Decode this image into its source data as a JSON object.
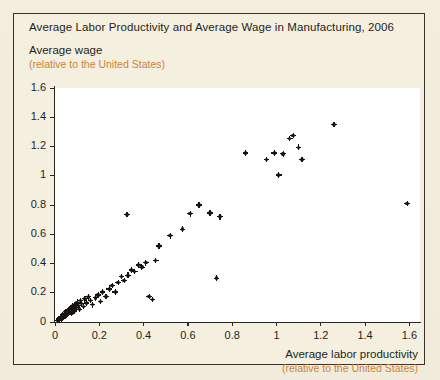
{
  "figure": {
    "title": "Average Labor Productivity and Average Wage in Manufacturing, 2006"
  },
  "axes": {
    "y_label_main": "Average wage",
    "y_label_sub": "(relative to the United States)",
    "x_label_main": "Average labor productivity",
    "x_label_sub": "(relative to the United States)"
  },
  "colors": {
    "page_background": "#f3eddd",
    "plot_background": "#ffffff",
    "frame_border": "#3a3228",
    "axis": "#2b2620",
    "text": "#241f1a",
    "accent_sub_label": "#c8853c",
    "marker": "#17140f"
  },
  "chart_data": {
    "type": "scatter",
    "title": "Average Labor Productivity and Average Wage in Manufacturing, 2006",
    "xlabel": "Average labor productivity (relative to the United States)",
    "ylabel": "Average wage (relative to the United States)",
    "xlim": [
      0,
      1.65
    ],
    "ylim": [
      0,
      1.6
    ],
    "xticks": [
      0,
      0.2,
      0.4,
      0.6,
      0.8,
      1,
      1.2,
      1.4,
      1.6
    ],
    "xtick_labels": [
      "0",
      "0.2",
      "0.4",
      "0.6",
      "0.8",
      "1",
      "1.2",
      "1.4",
      "1.6"
    ],
    "yticks": [
      0,
      0.2,
      0.4,
      0.6,
      0.8,
      1,
      1.2,
      1.4,
      1.6
    ],
    "ytick_labels": [
      "0",
      "0.2",
      "0.4",
      "0.6",
      "0.8",
      "1",
      "1.2",
      "1.4",
      "1.6"
    ],
    "grid": false,
    "legend": null,
    "marker_style": "plus-dot",
    "series": [
      {
        "name": "Countries",
        "points": [
          [
            0.01,
            0.012
          ],
          [
            0.015,
            0.018
          ],
          [
            0.018,
            0.022
          ],
          [
            0.022,
            0.015
          ],
          [
            0.025,
            0.03
          ],
          [
            0.028,
            0.022
          ],
          [
            0.03,
            0.04
          ],
          [
            0.033,
            0.028
          ],
          [
            0.035,
            0.05
          ],
          [
            0.038,
            0.035
          ],
          [
            0.04,
            0.045
          ],
          [
            0.042,
            0.06
          ],
          [
            0.045,
            0.038
          ],
          [
            0.048,
            0.055
          ],
          [
            0.05,
            0.07
          ],
          [
            0.052,
            0.048
          ],
          [
            0.055,
            0.065
          ],
          [
            0.058,
            0.08
          ],
          [
            0.06,
            0.058
          ],
          [
            0.062,
            0.072
          ],
          [
            0.065,
            0.09
          ],
          [
            0.068,
            0.068
          ],
          [
            0.07,
            0.1
          ],
          [
            0.073,
            0.082
          ],
          [
            0.076,
            0.062
          ],
          [
            0.08,
            0.11
          ],
          [
            0.083,
            0.092
          ],
          [
            0.086,
            0.075
          ],
          [
            0.09,
            0.12
          ],
          [
            0.095,
            0.1
          ],
          [
            0.1,
            0.135
          ],
          [
            0.105,
            0.112
          ],
          [
            0.11,
            0.088
          ],
          [
            0.115,
            0.145
          ],
          [
            0.12,
            0.125
          ],
          [
            0.128,
            0.105
          ],
          [
            0.135,
            0.158
          ],
          [
            0.142,
            0.13
          ],
          [
            0.15,
            0.172
          ],
          [
            0.16,
            0.148
          ],
          [
            0.17,
            0.118
          ],
          [
            0.182,
            0.165
          ],
          [
            0.195,
            0.185
          ],
          [
            0.205,
            0.14
          ],
          [
            0.215,
            0.205
          ],
          [
            0.23,
            0.175
          ],
          [
            0.245,
            0.225
          ],
          [
            0.258,
            0.25
          ],
          [
            0.272,
            0.205
          ],
          [
            0.285,
            0.27
          ],
          [
            0.3,
            0.31
          ],
          [
            0.312,
            0.285
          ],
          [
            0.325,
            0.735
          ],
          [
            0.33,
            0.32
          ],
          [
            0.345,
            0.355
          ],
          [
            0.36,
            0.345
          ],
          [
            0.378,
            0.39
          ],
          [
            0.392,
            0.375
          ],
          [
            0.41,
            0.405
          ],
          [
            0.425,
            0.175
          ],
          [
            0.44,
            0.155
          ],
          [
            0.455,
            0.42
          ],
          [
            0.47,
            0.52
          ],
          [
            0.52,
            0.59
          ],
          [
            0.575,
            0.635
          ],
          [
            0.61,
            0.74
          ],
          [
            0.65,
            0.8
          ],
          [
            0.7,
            0.745
          ],
          [
            0.73,
            0.3
          ],
          [
            0.745,
            0.72
          ],
          [
            0.86,
            1.155
          ],
          [
            0.955,
            1.11
          ],
          [
            0.99,
            1.155
          ],
          [
            1.01,
            1.005
          ],
          [
            1.03,
            1.15
          ],
          [
            1.06,
            1.255
          ],
          [
            1.075,
            1.275
          ],
          [
            1.1,
            1.195
          ],
          [
            1.115,
            1.11
          ],
          [
            1.26,
            1.35
          ],
          [
            1.59,
            0.81
          ]
        ]
      }
    ]
  }
}
